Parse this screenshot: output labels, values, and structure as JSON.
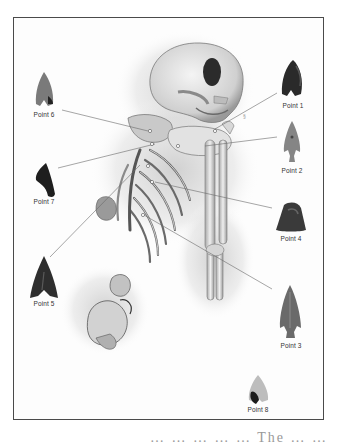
{
  "figure": {
    "type": "archaeological burial illustration",
    "frame_color": "#4a4a4a"
  },
  "points": [
    {
      "id": 1,
      "label": "Point 1",
      "x": 293,
      "y": 108,
      "shape": "arrowhead-dark",
      "color": "#2a2a2a"
    },
    {
      "id": 2,
      "label": "Point 2",
      "x": 292,
      "y": 171,
      "shape": "arrowhead-stemmed",
      "color": "#7a7a7a"
    },
    {
      "id": 3,
      "label": "Point 3",
      "x": 291,
      "y": 342,
      "shape": "arrowhead-long",
      "color": "#6a6a6a"
    },
    {
      "id": 4,
      "label": "Point 4",
      "x": 291,
      "y": 239,
      "shape": "trapezoid",
      "color": "#3a3a3a"
    },
    {
      "id": 5,
      "label": "Point 5",
      "x": 44,
      "y": 303,
      "shape": "triangle",
      "color": "#2e2e2e"
    },
    {
      "id": 6,
      "label": "Point 6",
      "x": 44,
      "y": 117,
      "shape": "arrowhead",
      "color": "#6e6e6e"
    },
    {
      "id": 7,
      "label": "Point 7",
      "x": 44,
      "y": 202,
      "shape": "fragment",
      "color": "#1e1e1e"
    },
    {
      "id": 8,
      "label": "Point 8",
      "x": 258,
      "y": 412,
      "shape": "arrowhead-bicolor",
      "color": "#2a2a2a"
    }
  ],
  "caption": {
    "text": "… … … … …  The … …"
  }
}
